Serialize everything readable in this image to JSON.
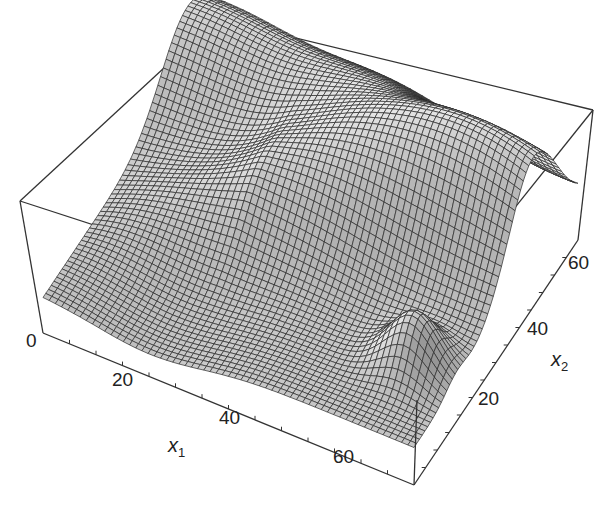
{
  "chart_data": {
    "type": "surface3d",
    "title": "",
    "xlabel": "x1",
    "ylabel": "x2",
    "zlabel": "",
    "x_axis": {
      "name": "x",
      "subscript": "1",
      "ticks": [
        "0",
        "20",
        "40",
        "60"
      ],
      "range": [
        0,
        70
      ]
    },
    "y_axis": {
      "name": "x",
      "subscript": "2",
      "ticks": [
        "20",
        "40",
        "60"
      ],
      "range": [
        0,
        70
      ]
    },
    "z_axis": {
      "ticks": []
    },
    "mesh": {
      "rows": 60,
      "cols": 60,
      "fill": "#bdbdbd",
      "line": "#2a2a2a"
    },
    "box": true
  },
  "labels": {
    "x1_ticks": [
      {
        "text": "0",
        "x": 26,
        "y": 342
      },
      {
        "text": "20",
        "x": 112,
        "y": 381
      },
      {
        "text": "40",
        "x": 219,
        "y": 419
      },
      {
        "text": "60",
        "x": 333,
        "y": 458
      }
    ],
    "x2_ticks": [
      {
        "text": "20",
        "x": 478,
        "y": 400
      },
      {
        "text": "40",
        "x": 527,
        "y": 330
      },
      {
        "text": "60",
        "x": 568,
        "y": 264
      }
    ],
    "x1_label": {
      "name": "x",
      "sub": "1",
      "x": 168,
      "y": 448
    },
    "x2_label": {
      "name": "x",
      "sub": "2",
      "x": 551,
      "y": 362
    }
  }
}
